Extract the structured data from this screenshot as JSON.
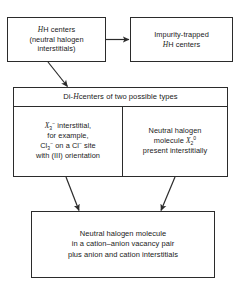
{
  "diagram": {
    "line_color": "#2b2b2b",
    "background": "#ffffff",
    "nodes": {
      "h_centers": {
        "line1": "H centers",
        "line2": "(neutral halogen",
        "line3": "interstitials)"
      },
      "impurity_trapped": {
        "line1": "Impurity-trapped",
        "line2": "H centers"
      },
      "di_h_header": {
        "prefix": "Di-",
        "italic": "H",
        "suffix": " centers of two possible types",
        "full": "Di-H centers of two possible types"
      },
      "di_h_left": {
        "line1_species": "X",
        "line1_sub": "3",
        "line1_sup": "−",
        "line1_rest": " interstitial,",
        "line2": "for example,",
        "line3": "Cl3− on a Cl− site",
        "line4": "with (III) orientation",
        "full": "X3− interstitial, for example, Cl3− on a Cl− site with (III) orientation"
      },
      "di_h_right": {
        "line1": "Neutral halogen",
        "line2_prefix": "molecule ",
        "line2_species": "X",
        "line2_sub": "2",
        "line2_sup": "0",
        "line3": "present interstitially",
        "full": "Neutral halogen molecule X20 present interstitially"
      },
      "bottom": {
        "line1": "Neutral halogen molecule",
        "line2": "in a cation–anion vacancy pair",
        "line3": "plus anion and cation interstitials",
        "full": "Neutral halogen molecule in a cation-anion vacancy pair plus anion and cation interstitials"
      }
    },
    "arrows": [
      {
        "name": "h-centers-to-impurity",
        "from": "h_centers",
        "to": "impurity_trapped",
        "style": "horizontal"
      },
      {
        "name": "h-centers-to-di-h",
        "from": "h_centers",
        "to": "di_h_header",
        "style": "diagonal-down-right"
      },
      {
        "name": "di-h-left-to-bottom",
        "from": "di_h_left",
        "to": "bottom",
        "style": "diagonal-down-right"
      },
      {
        "name": "di-h-right-to-bottom",
        "from": "di_h_right",
        "to": "bottom",
        "style": "diagonal-down-left"
      }
    ]
  }
}
